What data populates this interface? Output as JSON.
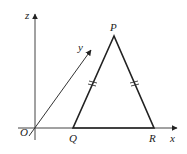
{
  "diagram": {
    "type": "3d-coordinate-geometry",
    "axes": {
      "x_label": "x",
      "y_label": "y",
      "z_label": "z",
      "origin_label": "O"
    },
    "triangle": {
      "vertices": [
        {
          "name": "P",
          "label": "P"
        },
        {
          "name": "Q",
          "label": "Q"
        },
        {
          "name": "R",
          "label": "R"
        }
      ],
      "equal_sides": [
        "PQ",
        "PR"
      ],
      "description": "Isosceles triangle PQR with Q and R on the x-axis; PQ = PR marked with double tick marks"
    },
    "colors": {
      "line": "#222222",
      "background": "#ffffff"
    }
  }
}
